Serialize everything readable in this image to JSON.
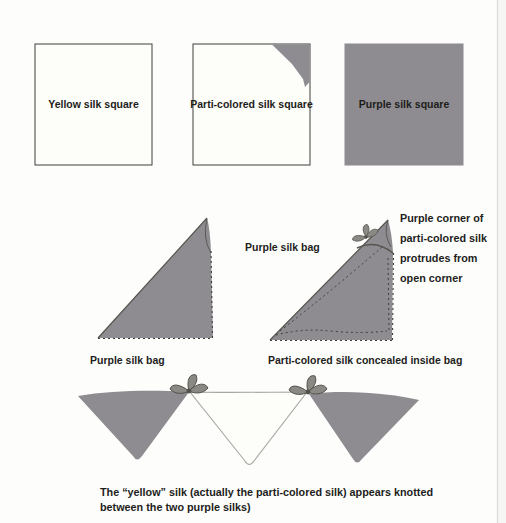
{
  "figure": {
    "top_row": {
      "yellow_label": "Yellow silk square",
      "parti_label": "Parti-colored silk square",
      "purple_label": "Purple silk square"
    },
    "middle_row": {
      "bag_side_label": "Purple silk bag",
      "left_bag_caption": "Purple silk bag",
      "right_bag_caption": "Parti-colored silk concealed inside bag",
      "annotation_lines": [
        "Purple corner of",
        "parti-colored silk",
        "protrudes from",
        "open corner"
      ]
    },
    "bottom_row": {
      "caption_line1": "The “yellow” silk (actually the parti-colored silk) appears knotted",
      "caption_line2": "between the two purple silks)"
    }
  },
  "colors": {
    "purple_silk": "#8e8c90",
    "white_silk": "#fdfdf9",
    "silk_outline": "#56544f",
    "dash_line": "#3e3d3a",
    "knot_fill": "#8b8983",
    "knot_stroke": "#53514b",
    "square_border": "#3f3f3d",
    "text": "#1d1d1b",
    "page_edge": "#dedddb",
    "page_margin": "#f6f6f4"
  }
}
